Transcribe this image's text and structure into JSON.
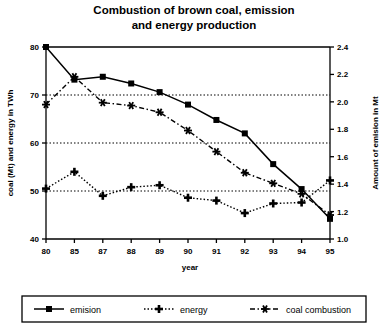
{
  "chart_data": {
    "type": "line",
    "title_line1": "Combustion of brown coal, emission",
    "title_line2": "and  energy production",
    "xlabel": "year",
    "ylabel": "coal (Mt) and energy in TWh",
    "y2label": "Amount of emision in Mt",
    "categories": [
      "80",
      "85",
      "87",
      "88",
      "89",
      "90",
      "91",
      "92",
      "93",
      "94",
      "95"
    ],
    "ylim": [
      40,
      80
    ],
    "yticks": [
      "40",
      "50",
      "60",
      "70",
      "80"
    ],
    "ytick_values": [
      40,
      50,
      60,
      70,
      80
    ],
    "y2lim": [
      1.0,
      2.4
    ],
    "y2ticks": [
      "1.0",
      "1.2",
      "1.4",
      "1.6",
      "1.8",
      "2.0",
      "2.2",
      "2.4"
    ],
    "y2tick_values": [
      1.0,
      1.2,
      1.4,
      1.6,
      1.8,
      2.0,
      2.2,
      2.4
    ],
    "gridlines": [
      50,
      60,
      70
    ],
    "grid": true,
    "legend_position": "bottom",
    "series": [
      {
        "name": "emision",
        "axis": "right",
        "marker": "square",
        "dash": "solid",
        "values_left_scale": [
          80.0,
          73.2,
          73.8,
          72.4,
          70.6,
          68.0,
          64.8,
          62.0,
          55.6,
          50.4,
          44.2
        ],
        "values": [
          2.4,
          2.16,
          2.18,
          2.13,
          2.07,
          1.98,
          1.87,
          1.77,
          1.55,
          1.36,
          1.15
        ]
      },
      {
        "name": "energy",
        "axis": "left",
        "marker": "plus",
        "dash": "dotted",
        "values": [
          50.5,
          54.0,
          49.0,
          50.8,
          51.2,
          48.6,
          48.0,
          45.4,
          47.4,
          47.6,
          52.2
        ]
      },
      {
        "name": "coal combustion",
        "axis": "left",
        "marker": "asterisk",
        "dash": "dashdot",
        "values": [
          68.0,
          73.8,
          68.4,
          67.8,
          66.4,
          62.6,
          58.2,
          53.8,
          51.6,
          49.4,
          45.0
        ]
      }
    ]
  },
  "legend": {
    "items": [
      {
        "label": "emision"
      },
      {
        "label": "energy"
      },
      {
        "label": "coal combustion"
      }
    ]
  },
  "colors": {
    "ink": "#000000",
    "background": "#ffffff",
    "grid": "#000000"
  }
}
